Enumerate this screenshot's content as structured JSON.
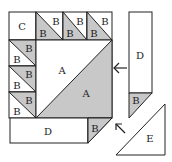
{
  "diagram": {
    "type": "quilt-block-assembly",
    "colors": {
      "shaded": "#c8c8c8",
      "outline": "#222222",
      "background": "#ffffff"
    },
    "pieces": {
      "corner": "C",
      "half_square": "B",
      "large_triangle": "A",
      "strip": "D",
      "side_triangle": "E"
    },
    "labels": {
      "c": "C",
      "b": "B",
      "a": "A",
      "d": "D",
      "e": "E"
    },
    "arrows": [
      {
        "name": "attach-right-strip",
        "direction": "left"
      },
      {
        "name": "attach-side-triangle",
        "direction": "up-left"
      }
    ]
  }
}
